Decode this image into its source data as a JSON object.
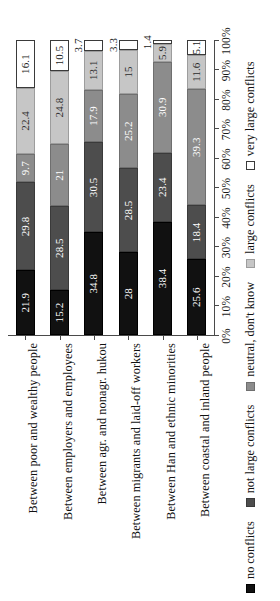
{
  "chart_data": {
    "type": "bar",
    "subtype": "100% stacked horizontal bar",
    "title": "",
    "xlabel": "",
    "ylabel": "",
    "xlim": [
      0,
      100
    ],
    "grid": false,
    "legend_position": "bottom",
    "axis_tick_labels": [
      "0%",
      "10%",
      "20%",
      "30%",
      "40%",
      "50%",
      "60%",
      "70%",
      "80%",
      "90%",
      "100%"
    ],
    "axis_tick_values": [
      0,
      10,
      20,
      30,
      40,
      50,
      60,
      70,
      80,
      90,
      100
    ],
    "categories": [
      "Between poor and wealthy people",
      "Between employers and employees",
      "Between agr. and nonagr. hukou",
      "Between migrants and laid-off workers",
      "Between Han and ethnic minorities",
      "Between coastal and inland people"
    ],
    "series": [
      {
        "name": "no conflicts",
        "color": "#111111",
        "values": [
          21.9,
          15.2,
          34.8,
          28,
          38.4,
          25.6
        ],
        "labels": [
          "21.9",
          "15.2",
          "34.8",
          "28",
          "38.4",
          "25.6"
        ]
      },
      {
        "name": "not large conflicts",
        "color": "#4d4d4d",
        "values": [
          29.8,
          28.5,
          30.5,
          28.5,
          23.4,
          18.4
        ],
        "labels": [
          "29.8",
          "28.5",
          "30.5",
          "28.5",
          "23.4",
          "18.4"
        ]
      },
      {
        "name": "neutral, don't know",
        "color": "#8c8c8c",
        "values": [
          9.7,
          21,
          17.9,
          25.2,
          30.9,
          39.3
        ],
        "labels": [
          "9.7",
          "21",
          "17.9",
          "25.2",
          "30.9",
          "39.3"
        ]
      },
      {
        "name": "large conflicts",
        "color": "#c6c6c6",
        "values": [
          22.4,
          24.8,
          13.1,
          15,
          5.9,
          11.6
        ],
        "labels": [
          "22.4",
          "24.8",
          "13.1",
          "15",
          "5.9",
          "11.6"
        ]
      },
      {
        "name": "very large conflicts",
        "color": "#ffffff",
        "values": [
          16.1,
          10.5,
          3.7,
          3.3,
          1.4,
          5.1
        ],
        "labels": [
          "16.1",
          "10.5",
          "3.7",
          "3.3",
          "1.4",
          "5.1"
        ]
      }
    ]
  },
  "legend": {
    "items": [
      {
        "label": "no conflicts",
        "swatch": "swatch-no-conflicts"
      },
      {
        "label": "not large conflicts",
        "swatch": "swatch-not-large-conflicts"
      },
      {
        "label": "neutral, don't know",
        "swatch": "swatch-neutral"
      },
      {
        "label": "large conflicts",
        "swatch": "swatch-large-conflicts"
      },
      {
        "label": "very large conflicts",
        "swatch": "swatch-very-large-conflicts"
      }
    ]
  }
}
